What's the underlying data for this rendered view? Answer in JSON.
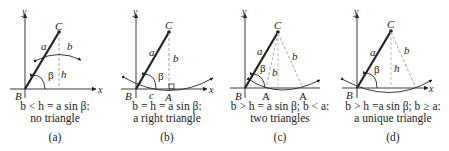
{
  "panels": [
    {
      "id": "a",
      "labels": {
        "y": "y",
        "x": "x",
        "B": "B",
        "C": "C",
        "a": "a",
        "b": "b",
        "h": "h",
        "beta": "β"
      },
      "condition": "b < h = a sin β:",
      "result": "no triangle",
      "tag": "(a)"
    },
    {
      "id": "b",
      "labels": {
        "y": "y",
        "x": "x",
        "B": "B",
        "C": "C",
        "A": "A",
        "a": "a",
        "b": "b",
        "c": "c",
        "beta": "β"
      },
      "condition": "b = h = a sin β:",
      "result": "a right triangle",
      "tag": "(b)"
    },
    {
      "id": "c",
      "labels": {
        "y": "y",
        "B": "B",
        "C": "C",
        "A1": "A",
        "A2": "A",
        "a": "a",
        "b1": "b",
        "b2": "b",
        "beta": "β"
      },
      "condition": "b > h = a sin β; b < a:",
      "result": "two triangles",
      "tag": "(c)"
    },
    {
      "id": "d",
      "labels": {
        "y": "y",
        "x": "x",
        "B": "B",
        "C": "C",
        "a": "a",
        "b": "b",
        "h": "h",
        "beta": "β"
      },
      "condition": "b > h =a sin β; b ≥ a:",
      "result": "a unique triangle",
      "tag": "(d)"
    }
  ],
  "colors": {
    "ink": "#222222",
    "dash": "#9a9a9a"
  }
}
